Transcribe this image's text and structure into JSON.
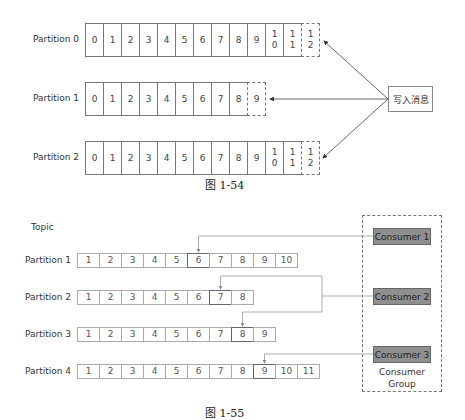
{
  "figure_1": {
    "caption": "图 1-54",
    "write_box_label": "写入消息",
    "partitions": [
      {
        "label": "Partition 0",
        "cells": [
          "0",
          "1",
          "2",
          "3",
          "4",
          "5",
          "6",
          "7",
          "8",
          "9",
          "1\n0",
          "1\n1"
        ],
        "pending": "1\n2"
      },
      {
        "label": "Partition 1",
        "cells": [
          "0",
          "1",
          "2",
          "3",
          "4",
          "5",
          "6",
          "7",
          "8"
        ],
        "pending": "9"
      },
      {
        "label": "Partition 2",
        "cells": [
          "0",
          "1",
          "2",
          "3",
          "4",
          "5",
          "6",
          "7",
          "8",
          "9",
          "1\n0",
          "1\n1"
        ],
        "pending": "1\n2"
      }
    ]
  },
  "figure_2": {
    "caption": "图 1-55",
    "topic_label": "Topic",
    "partitions": [
      {
        "label": "Partition 1",
        "cells": [
          "1",
          "2",
          "3",
          "4",
          "5",
          "6",
          "7",
          "8",
          "9",
          "10"
        ],
        "offset_index": 5
      },
      {
        "label": "Partition 2",
        "cells": [
          "1",
          "2",
          "3",
          "4",
          "5",
          "6",
          "7",
          "8"
        ],
        "offset_index": 6
      },
      {
        "label": "Partition 3",
        "cells": [
          "1",
          "2",
          "3",
          "4",
          "5",
          "6",
          "7",
          "8",
          "9"
        ],
        "offset_index": 7
      },
      {
        "label": "Partition 4",
        "cells": [
          "1",
          "2",
          "3",
          "4",
          "5",
          "6",
          "7",
          "8",
          "9",
          "10",
          "11"
        ],
        "offset_index": 8
      }
    ],
    "consumers": [
      "Consumer 1",
      "Consumer 2",
      "Consumer 3"
    ],
    "group_label": "Consumer\nGroup",
    "colors": {
      "consumer_fill": "#8f8f8f",
      "line": "#999999"
    }
  }
}
